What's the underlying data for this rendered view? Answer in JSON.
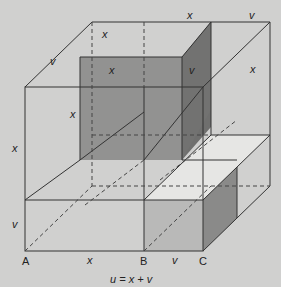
{
  "diagram": {
    "formula": "u = x + v",
    "points": {
      "A": "A",
      "B": "B",
      "C": "C"
    },
    "edge_labels": {
      "top_back_x": "x",
      "top_back_v": "v",
      "left_top_x": "x",
      "left_top_v": "v",
      "dark_front_x": "x",
      "dark_side_x": "x",
      "dark_right_v": "v",
      "right_face_x": "x",
      "left_x": "x",
      "left_v": "v",
      "bottom_x": "x",
      "bottom_v": "v"
    },
    "colors": {
      "background": "#d0d0cf",
      "dark_fill": "#8f8f8e",
      "darker_fill": "#6f6f6e",
      "light_fill": "#e6e6e4",
      "mid_fill": "#b9b9b8",
      "line": "#333333"
    }
  }
}
